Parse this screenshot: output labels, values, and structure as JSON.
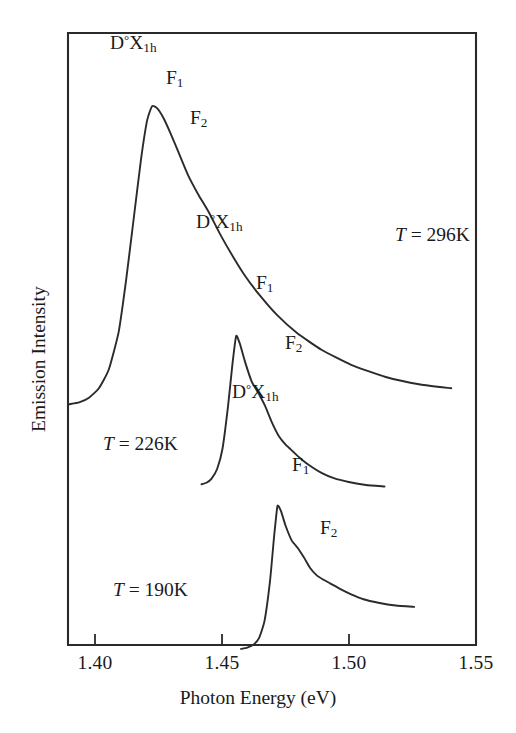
{
  "figure": {
    "domain": "chart",
    "background_color": "#ffffff",
    "ink_color": "#2b2b2b"
  },
  "chart_data": {
    "type": "line",
    "title": "",
    "subtitle": "",
    "xlabel": "Photon Energy (eV)",
    "ylabel": "Emission Intensity",
    "xlim": [
      1.3875,
      1.5525
    ],
    "ylim": [
      0,
      1
    ],
    "xticks": [
      1.4,
      1.45,
      1.5,
      1.55
    ],
    "xtick_labels": [
      "1.40",
      "1.45",
      "1.50",
      "1.55"
    ],
    "yticks": [],
    "ytick_labels": [],
    "grid": false,
    "legend": "none",
    "frame": "box",
    "series": [
      {
        "name": "T = 296K",
        "temperature_k": 296,
        "x_range": [
          1.388,
          1.5425
        ],
        "peak_energy_ev": 1.4215,
        "annotations": [
          {
            "label": "D°X1h",
            "energy_ev": 1.4215
          },
          {
            "label": "F1",
            "energy_ev": 1.4345
          },
          {
            "label": "F2",
            "energy_ev": 1.4425
          }
        ],
        "x": [
          1.388,
          1.392,
          1.396,
          1.4,
          1.404,
          1.408,
          1.411,
          1.414,
          1.417,
          1.4195,
          1.4215,
          1.4235,
          1.426,
          1.429,
          1.4325,
          1.436,
          1.44,
          1.4445,
          1.449,
          1.454,
          1.459,
          1.465,
          1.472,
          1.48,
          1.49,
          1.502,
          1.516,
          1.53,
          1.5425
        ],
        "y": [
          0.108,
          0.112,
          0.122,
          0.142,
          0.182,
          0.262,
          0.372,
          0.5,
          0.628,
          0.712,
          0.742,
          0.738,
          0.718,
          0.684,
          0.64,
          0.596,
          0.556,
          0.516,
          0.47,
          0.424,
          0.382,
          0.34,
          0.298,
          0.26,
          0.224,
          0.192,
          0.166,
          0.15,
          0.142
        ]
      },
      {
        "name": "T = 226K",
        "temperature_k": 226,
        "x_range": [
          1.4415,
          1.5155
        ],
        "peak_energy_ev": 1.4555,
        "annotations": [
          {
            "label": "D°X1h",
            "energy_ev": 1.4555
          },
          {
            "label": "F1",
            "energy_ev": 1.4645
          },
          {
            "label": "F2",
            "energy_ev": 1.4755
          }
        ],
        "x": [
          1.4415,
          1.4435,
          1.4455,
          1.4478,
          1.45,
          1.4522,
          1.454,
          1.4555,
          1.457,
          1.4592,
          1.4618,
          1.4645,
          1.4672,
          1.47,
          1.4728,
          1.4755,
          1.4785,
          1.4815,
          1.4855,
          1.49,
          1.495,
          1.501,
          1.508,
          1.5155
        ],
        "y": [
          0.352,
          0.356,
          0.366,
          0.392,
          0.446,
          0.556,
          0.668,
          0.742,
          0.722,
          0.672,
          0.622,
          0.592,
          0.558,
          0.514,
          0.478,
          0.456,
          0.438,
          0.42,
          0.4,
          0.382,
          0.368,
          0.358,
          0.35,
          0.346
        ]
      },
      {
        "name": "T = 190K",
        "temperature_k": 190,
        "x_range": [
          1.4575,
          1.5275
        ],
        "peak_energy_ev": 1.4722,
        "annotations": [
          {
            "label": "D°X1h",
            "energy_ev": 1.4722
          },
          {
            "label": "F1",
            "energy_ev": 1.4805
          },
          {
            "label": "F2",
            "energy_ev": 1.4905
          }
        ],
        "x": [
          1.4575,
          1.46,
          1.4625,
          1.4648,
          1.467,
          1.4692,
          1.4708,
          1.4722,
          1.4736,
          1.4755,
          1.478,
          1.4805,
          1.483,
          1.4855,
          1.488,
          1.4905,
          1.4935,
          1.4975,
          1.502,
          1.507,
          1.513,
          1.52,
          1.5275
        ],
        "y": [
          0.148,
          0.152,
          0.16,
          0.18,
          0.23,
          0.345,
          0.47,
          0.562,
          0.548,
          0.505,
          0.462,
          0.44,
          0.412,
          0.382,
          0.362,
          0.35,
          0.338,
          0.322,
          0.306,
          0.292,
          0.282,
          0.274,
          0.27
        ]
      }
    ],
    "annotation_labels": {
      "bound_exciton": "D°X1h",
      "phonon_replica_1": "F1",
      "phonon_replica_2": "F2"
    }
  },
  "axes": {
    "x_title": "Photon Energy (eV)",
    "y_title": "Emission Intensity",
    "x_tick_labels": [
      "1.40",
      "1.45",
      "1.50",
      "1.55"
    ]
  },
  "annotations": {
    "trace_296": {
      "dox_prefix": "D",
      "dox_sup": "°",
      "dox_letter": "X",
      "dox_sub": "1h",
      "f1_letter": "F",
      "f1_sub": "1",
      "f2_letter": "F",
      "f2_sub": "2",
      "temp_sym": "T",
      "temp_value": "= 296K"
    },
    "trace_226": {
      "dox_prefix": "D",
      "dox_sup": "°",
      "dox_letter": "X",
      "dox_sub": "1h",
      "f1_letter": "F",
      "f1_sub": "1",
      "f2_letter": "F",
      "f2_sub": "2",
      "temp_sym": "T",
      "temp_value": "= 226K"
    },
    "trace_190": {
      "dox_prefix": "D",
      "dox_sup": "°",
      "dox_letter": "X",
      "dox_sub": "1h",
      "f1_letter": "F",
      "f1_sub": "1",
      "f2_letter": "F",
      "f2_sub": "2",
      "temp_sym": "T",
      "temp_value": "= 190K"
    }
  }
}
